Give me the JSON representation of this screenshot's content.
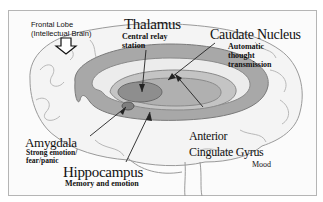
{
  "diagram": {
    "type": "labeled brain anatomy illustration",
    "colors": {
      "background": "#ffffff",
      "frame": "#b5b5b5",
      "outline": "#8a8a8a",
      "structure_fill": "#9a9a9a",
      "structure_light": "#c4c4c4",
      "text": "#111111"
    },
    "labels": {
      "frontal_lobe": {
        "title_line1": "Frontal Lobe",
        "title_line2": "(Intellectual Brain)",
        "arrow": "down-arrow"
      },
      "thalamus": {
        "title": "Thalamus",
        "desc_line1": "Central relay",
        "desc_line2": "station"
      },
      "caudate_nucleus": {
        "title": "Caudate Nucleus",
        "desc_line1": "Automatic",
        "desc_line2": "thought",
        "desc_line3": "transmission"
      },
      "amygdala": {
        "title": "Amygdala",
        "desc_line1": "Strong emotion/",
        "desc_line2": "fear/panic"
      },
      "hippocampus": {
        "title": "Hippocampus",
        "desc_line1": "Memory and emotion"
      },
      "anterior_cingulate_gyrus": {
        "title_line1": "Anterior",
        "title_line2": "Cingulate Gyrus",
        "desc_line1": "Mood"
      }
    }
  }
}
